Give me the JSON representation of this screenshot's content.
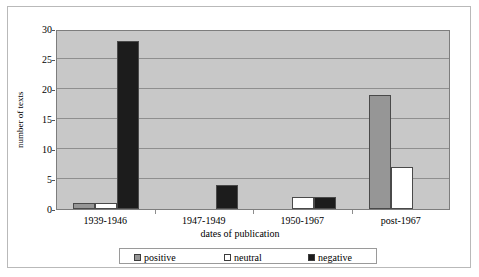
{
  "chart_data": {
    "type": "bar",
    "title": "",
    "xlabel": "dates of publication",
    "ylabel": "number of texts",
    "categories": [
      "1939-1946",
      "1947-1949",
      "1950-1967",
      "post-1967"
    ],
    "series": [
      {
        "name": "positive",
        "values": [
          1,
          0,
          0,
          19
        ],
        "color": "#969696"
      },
      {
        "name": "neutral",
        "values": [
          1,
          0,
          2,
          7
        ],
        "color": "#ffffff"
      },
      {
        "name": "negative",
        "values": [
          28,
          4,
          2,
          0
        ],
        "color": "#1c1c1c"
      }
    ],
    "ylim": [
      0,
      30
    ],
    "yticks": [
      0,
      5,
      10,
      15,
      20,
      25,
      30
    ],
    "ytick_labels": [
      "0",
      "5",
      "10",
      "15",
      "20",
      "25",
      "30"
    ],
    "grid": true,
    "legend_position": "bottom",
    "plot_background": "#c8c8c8",
    "gridline_color": "#8f8f8f"
  }
}
